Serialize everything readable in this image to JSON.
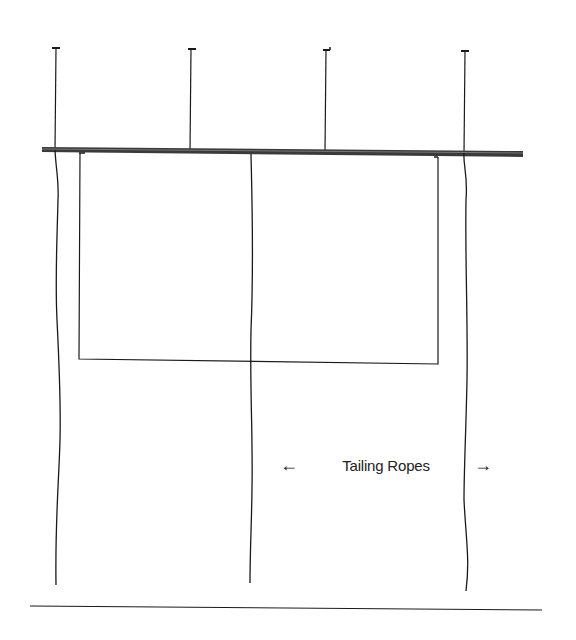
{
  "diagram": {
    "type": "rigging-illustration",
    "colors": {
      "line": "#1a1a1a",
      "batten": "#3a3a3a",
      "background": "#ffffff"
    },
    "components": {
      "lift_lines": 4,
      "batten": "horizontal pipe batten",
      "drop": "rectangular drop below batten",
      "tailing_ropes": 3,
      "floor": "floor line"
    }
  },
  "labels": {
    "tailing_ropes": {
      "text": "Tailing Ropes",
      "left_arrow": "←",
      "right_arrow": "→"
    }
  }
}
